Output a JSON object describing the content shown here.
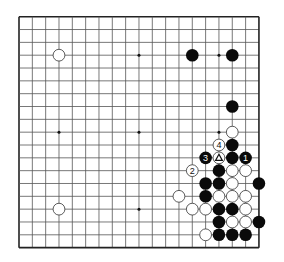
{
  "board": {
    "size": 19,
    "origin_x": 19,
    "origin_y": 16.7,
    "cell_w": 13.33,
    "cell_h": 12.83,
    "line_color": "#555555",
    "border_color": "#222222",
    "background": "#ffffff",
    "star_points": [
      [
        3,
        3
      ],
      [
        3,
        9
      ],
      [
        3,
        15
      ],
      [
        9,
        3
      ],
      [
        9,
        9
      ],
      [
        9,
        15
      ],
      [
        15,
        3
      ],
      [
        15,
        9
      ],
      [
        15,
        15
      ]
    ]
  },
  "colors": {
    "black": "#0a0a0a",
    "white": "#ffffff",
    "white_stroke": "#333333"
  },
  "stones": [
    {
      "color": "white",
      "col": 3,
      "row": 3
    },
    {
      "color": "white",
      "col": 3,
      "row": 15
    },
    {
      "color": "black",
      "col": 13,
      "row": 3
    },
    {
      "color": "black",
      "col": 16,
      "row": 3
    },
    {
      "color": "black",
      "col": 16,
      "row": 7
    },
    {
      "color": "white",
      "col": 16,
      "row": 9
    },
    {
      "color": "white",
      "col": 15,
      "row": 10,
      "label": "4"
    },
    {
      "color": "black",
      "col": 16,
      "row": 10
    },
    {
      "color": "black",
      "col": 14,
      "row": 11,
      "label": "3"
    },
    {
      "color": "white",
      "col": 15,
      "row": 11,
      "mark": "triangle"
    },
    {
      "color": "black",
      "col": 16,
      "row": 11
    },
    {
      "color": "black",
      "col": 17,
      "row": 11,
      "label": "1"
    },
    {
      "color": "white",
      "col": 13,
      "row": 12,
      "label": "2"
    },
    {
      "color": "black",
      "col": 15,
      "row": 12
    },
    {
      "color": "white",
      "col": 16,
      "row": 12
    },
    {
      "color": "white",
      "col": 17,
      "row": 12
    },
    {
      "color": "black",
      "col": 14,
      "row": 13
    },
    {
      "color": "black",
      "col": 15,
      "row": 13
    },
    {
      "color": "white",
      "col": 16,
      "row": 13
    },
    {
      "color": "black",
      "col": 18,
      "row": 13
    },
    {
      "color": "white",
      "col": 12,
      "row": 14
    },
    {
      "color": "black",
      "col": 14,
      "row": 14
    },
    {
      "color": "white",
      "col": 15,
      "row": 14
    },
    {
      "color": "white",
      "col": 16,
      "row": 14
    },
    {
      "color": "white",
      "col": 17,
      "row": 14
    },
    {
      "color": "white",
      "col": 13,
      "row": 15
    },
    {
      "color": "white",
      "col": 14,
      "row": 15
    },
    {
      "color": "black",
      "col": 15,
      "row": 15
    },
    {
      "color": "black",
      "col": 16,
      "row": 15
    },
    {
      "color": "white",
      "col": 17,
      "row": 15
    },
    {
      "color": "black",
      "col": 15,
      "row": 16
    },
    {
      "color": "white",
      "col": 16,
      "row": 16
    },
    {
      "color": "white",
      "col": 17,
      "row": 16
    },
    {
      "color": "black",
      "col": 18,
      "row": 16
    },
    {
      "color": "white",
      "col": 14,
      "row": 17
    },
    {
      "color": "black",
      "col": 15,
      "row": 17
    },
    {
      "color": "black",
      "col": 16,
      "row": 17
    },
    {
      "color": "black",
      "col": 17,
      "row": 17
    }
  ]
}
